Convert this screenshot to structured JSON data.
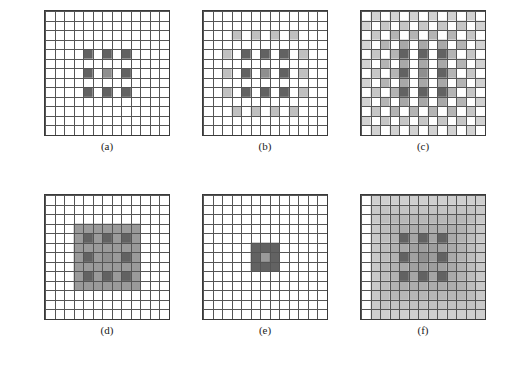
{
  "figure": {
    "title": "",
    "background": "#ffffff",
    "grid_line_color": "#555555",
    "grid_border_color": "#3a3a3a",
    "cell_empty_color": "#ffffff",
    "rows": 2,
    "cols": 3,
    "grid_size": 13
  },
  "palette": {
    "dark": "#626262",
    "dark_alt": "#6b6b6b",
    "mid": "#8f8f8f",
    "light": "#b4b4b4",
    "lighter": "#c9c9c9",
    "lightest": "#dcdcdc",
    "white": "#ffffff"
  },
  "panels": [
    {
      "id": "a",
      "caption": "(a)",
      "description": "sparse 3x3 checkerboard of dark cells at center",
      "size": 13,
      "cells": [
        {
          "r": 4,
          "c": 4,
          "color": "#626262"
        },
        {
          "r": 4,
          "c": 6,
          "color": "#626262"
        },
        {
          "r": 4,
          "c": 8,
          "color": "#626262"
        },
        {
          "r": 6,
          "c": 4,
          "color": "#626262"
        },
        {
          "r": 6,
          "c": 6,
          "color": "#8f8f8f"
        },
        {
          "r": 6,
          "c": 8,
          "color": "#626262"
        },
        {
          "r": 8,
          "c": 4,
          "color": "#626262"
        },
        {
          "r": 8,
          "c": 6,
          "color": "#626262"
        },
        {
          "r": 8,
          "c": 8,
          "color": "#626262"
        }
      ]
    },
    {
      "id": "b",
      "caption": "(b)",
      "description": "dark core plus one light-gray checkerboard ring",
      "size": 13,
      "cells": [
        {
          "r": 2,
          "c": 3,
          "color": "#c0c0c0"
        },
        {
          "r": 2,
          "c": 5,
          "color": "#c0c0c0"
        },
        {
          "r": 2,
          "c": 7,
          "color": "#c0c0c0"
        },
        {
          "r": 2,
          "c": 9,
          "color": "#c0c0c0"
        },
        {
          "r": 4,
          "c": 2,
          "color": "#c0c0c0"
        },
        {
          "r": 4,
          "c": 4,
          "color": "#626262"
        },
        {
          "r": 4,
          "c": 6,
          "color": "#626262"
        },
        {
          "r": 4,
          "c": 8,
          "color": "#626262"
        },
        {
          "r": 4,
          "c": 10,
          "color": "#c0c0c0"
        },
        {
          "r": 6,
          "c": 2,
          "color": "#c0c0c0"
        },
        {
          "r": 6,
          "c": 4,
          "color": "#626262"
        },
        {
          "r": 6,
          "c": 6,
          "color": "#8f8f8f"
        },
        {
          "r": 6,
          "c": 8,
          "color": "#626262"
        },
        {
          "r": 6,
          "c": 10,
          "color": "#c0c0c0"
        },
        {
          "r": 8,
          "c": 2,
          "color": "#c0c0c0"
        },
        {
          "r": 8,
          "c": 4,
          "color": "#626262"
        },
        {
          "r": 8,
          "c": 6,
          "color": "#626262"
        },
        {
          "r": 8,
          "c": 8,
          "color": "#626262"
        },
        {
          "r": 8,
          "c": 10,
          "color": "#c0c0c0"
        },
        {
          "r": 10,
          "c": 3,
          "color": "#c0c0c0"
        },
        {
          "r": 10,
          "c": 5,
          "color": "#c0c0c0"
        },
        {
          "r": 10,
          "c": 7,
          "color": "#c0c0c0"
        },
        {
          "r": 10,
          "c": 9,
          "color": "#c0c0c0"
        }
      ]
    },
    {
      "id": "c",
      "caption": "(c)",
      "description": "dark core plus wide light-gray checkerboard field",
      "size": 13,
      "cells": [
        {
          "r": 0,
          "c": 1,
          "color": "#d2d2d2"
        },
        {
          "r": 0,
          "c": 3,
          "color": "#d2d2d2"
        },
        {
          "r": 0,
          "c": 5,
          "color": "#d2d2d2"
        },
        {
          "r": 0,
          "c": 7,
          "color": "#d2d2d2"
        },
        {
          "r": 0,
          "c": 9,
          "color": "#d2d2d2"
        },
        {
          "r": 0,
          "c": 11,
          "color": "#d2d2d2"
        },
        {
          "r": 1,
          "c": 0,
          "color": "#d2d2d2"
        },
        {
          "r": 1,
          "c": 2,
          "color": "#c6c6c6"
        },
        {
          "r": 1,
          "c": 4,
          "color": "#c6c6c6"
        },
        {
          "r": 1,
          "c": 6,
          "color": "#c6c6c6"
        },
        {
          "r": 1,
          "c": 8,
          "color": "#c6c6c6"
        },
        {
          "r": 1,
          "c": 10,
          "color": "#c6c6c6"
        },
        {
          "r": 1,
          "c": 12,
          "color": "#d2d2d2"
        },
        {
          "r": 2,
          "c": 1,
          "color": "#c6c6c6"
        },
        {
          "r": 2,
          "c": 3,
          "color": "#b4b4b4"
        },
        {
          "r": 2,
          "c": 5,
          "color": "#b4b4b4"
        },
        {
          "r": 2,
          "c": 7,
          "color": "#b4b4b4"
        },
        {
          "r": 2,
          "c": 9,
          "color": "#b4b4b4"
        },
        {
          "r": 2,
          "c": 11,
          "color": "#c6c6c6"
        },
        {
          "r": 3,
          "c": 0,
          "color": "#d2d2d2"
        },
        {
          "r": 3,
          "c": 2,
          "color": "#b4b4b4"
        },
        {
          "r": 3,
          "c": 4,
          "color": "#a8a8a8"
        },
        {
          "r": 3,
          "c": 6,
          "color": "#a8a8a8"
        },
        {
          "r": 3,
          "c": 8,
          "color": "#a8a8a8"
        },
        {
          "r": 3,
          "c": 10,
          "color": "#b4b4b4"
        },
        {
          "r": 3,
          "c": 12,
          "color": "#d2d2d2"
        },
        {
          "r": 4,
          "c": 1,
          "color": "#c6c6c6"
        },
        {
          "r": 4,
          "c": 3,
          "color": "#b4b4b4"
        },
        {
          "r": 4,
          "c": 4,
          "color": "#626262"
        },
        {
          "r": 4,
          "c": 6,
          "color": "#626262"
        },
        {
          "r": 4,
          "c": 8,
          "color": "#626262"
        },
        {
          "r": 4,
          "c": 9,
          "color": "#b4b4b4"
        },
        {
          "r": 4,
          "c": 11,
          "color": "#c6c6c6"
        },
        {
          "r": 5,
          "c": 0,
          "color": "#d2d2d2"
        },
        {
          "r": 5,
          "c": 2,
          "color": "#b4b4b4"
        },
        {
          "r": 5,
          "c": 4,
          "color": "#a8a8a8"
        },
        {
          "r": 5,
          "c": 6,
          "color": "#a8a8a8"
        },
        {
          "r": 5,
          "c": 8,
          "color": "#a8a8a8"
        },
        {
          "r": 5,
          "c": 10,
          "color": "#b4b4b4"
        },
        {
          "r": 5,
          "c": 12,
          "color": "#d2d2d2"
        },
        {
          "r": 6,
          "c": 1,
          "color": "#c6c6c6"
        },
        {
          "r": 6,
          "c": 3,
          "color": "#b4b4b4"
        },
        {
          "r": 6,
          "c": 4,
          "color": "#626262"
        },
        {
          "r": 6,
          "c": 6,
          "color": "#8f8f8f"
        },
        {
          "r": 6,
          "c": 8,
          "color": "#626262"
        },
        {
          "r": 6,
          "c": 9,
          "color": "#b4b4b4"
        },
        {
          "r": 6,
          "c": 11,
          "color": "#c6c6c6"
        },
        {
          "r": 7,
          "c": 0,
          "color": "#d2d2d2"
        },
        {
          "r": 7,
          "c": 2,
          "color": "#b4b4b4"
        },
        {
          "r": 7,
          "c": 4,
          "color": "#a8a8a8"
        },
        {
          "r": 7,
          "c": 6,
          "color": "#a8a8a8"
        },
        {
          "r": 7,
          "c": 8,
          "color": "#a8a8a8"
        },
        {
          "r": 7,
          "c": 10,
          "color": "#b4b4b4"
        },
        {
          "r": 7,
          "c": 12,
          "color": "#d2d2d2"
        },
        {
          "r": 8,
          "c": 1,
          "color": "#c6c6c6"
        },
        {
          "r": 8,
          "c": 3,
          "color": "#b4b4b4"
        },
        {
          "r": 8,
          "c": 4,
          "color": "#626262"
        },
        {
          "r": 8,
          "c": 6,
          "color": "#626262"
        },
        {
          "r": 8,
          "c": 8,
          "color": "#626262"
        },
        {
          "r": 8,
          "c": 9,
          "color": "#b4b4b4"
        },
        {
          "r": 8,
          "c": 11,
          "color": "#c6c6c6"
        },
        {
          "r": 9,
          "c": 0,
          "color": "#d2d2d2"
        },
        {
          "r": 9,
          "c": 2,
          "color": "#b4b4b4"
        },
        {
          "r": 9,
          "c": 4,
          "color": "#a8a8a8"
        },
        {
          "r": 9,
          "c": 6,
          "color": "#a8a8a8"
        },
        {
          "r": 9,
          "c": 8,
          "color": "#a8a8a8"
        },
        {
          "r": 9,
          "c": 10,
          "color": "#b4b4b4"
        },
        {
          "r": 9,
          "c": 12,
          "color": "#d2d2d2"
        },
        {
          "r": 10,
          "c": 1,
          "color": "#c6c6c6"
        },
        {
          "r": 10,
          "c": 3,
          "color": "#b4b4b4"
        },
        {
          "r": 10,
          "c": 5,
          "color": "#b4b4b4"
        },
        {
          "r": 10,
          "c": 7,
          "color": "#b4b4b4"
        },
        {
          "r": 10,
          "c": 9,
          "color": "#b4b4b4"
        },
        {
          "r": 10,
          "c": 11,
          "color": "#c6c6c6"
        },
        {
          "r": 11,
          "c": 0,
          "color": "#d2d2d2"
        },
        {
          "r": 11,
          "c": 2,
          "color": "#c6c6c6"
        },
        {
          "r": 11,
          "c": 4,
          "color": "#c6c6c6"
        },
        {
          "r": 11,
          "c": 6,
          "color": "#c6c6c6"
        },
        {
          "r": 11,
          "c": 8,
          "color": "#c6c6c6"
        },
        {
          "r": 11,
          "c": 10,
          "color": "#c6c6c6"
        },
        {
          "r": 11,
          "c": 12,
          "color": "#d2d2d2"
        },
        {
          "r": 12,
          "c": 1,
          "color": "#d2d2d2"
        },
        {
          "r": 12,
          "c": 3,
          "color": "#d2d2d2"
        },
        {
          "r": 12,
          "c": 5,
          "color": "#d2d2d2"
        },
        {
          "r": 12,
          "c": 7,
          "color": "#d2d2d2"
        },
        {
          "r": 12,
          "c": 9,
          "color": "#d2d2d2"
        },
        {
          "r": 12,
          "c": 11,
          "color": "#d2d2d2"
        }
      ]
    },
    {
      "id": "d",
      "caption": "(d)",
      "description": "solid mid-gray 7x7 block containing dark checkerboard core",
      "size": 13,
      "block": {
        "r0": 3,
        "c0": 3,
        "r1": 9,
        "c1": 9,
        "color": "#9a9a9a"
      },
      "cells": [
        {
          "r": 4,
          "c": 4,
          "color": "#626262"
        },
        {
          "r": 4,
          "c": 6,
          "color": "#626262"
        },
        {
          "r": 4,
          "c": 8,
          "color": "#626262"
        },
        {
          "r": 6,
          "c": 4,
          "color": "#626262"
        },
        {
          "r": 6,
          "c": 6,
          "color": "#8f8f8f"
        },
        {
          "r": 6,
          "c": 8,
          "color": "#626262"
        },
        {
          "r": 8,
          "c": 4,
          "color": "#626262"
        },
        {
          "r": 8,
          "c": 6,
          "color": "#626262"
        },
        {
          "r": 8,
          "c": 8,
          "color": "#626262"
        }
      ]
    },
    {
      "id": "e",
      "caption": "(e)",
      "description": "solid dark 3x3 block with lighter center cell",
      "size": 13,
      "block": {
        "r0": 5,
        "c0": 5,
        "r1": 7,
        "c1": 7,
        "color": "#626262"
      },
      "cells": [
        {
          "r": 6,
          "c": 6,
          "color": "#9a9a9a"
        }
      ]
    },
    {
      "id": "f",
      "caption": "(f)",
      "description": "broad radial gray gradient field with dark checkerboard core",
      "size": 13,
      "gradient": {
        "r0": 0,
        "c0": 1,
        "r1": 12,
        "c1": 12,
        "center_color": "#9a9a9a",
        "edge_color": "#cfcfcf"
      },
      "cells": [
        {
          "r": 4,
          "c": 4,
          "color": "#626262"
        },
        {
          "r": 4,
          "c": 6,
          "color": "#626262"
        },
        {
          "r": 4,
          "c": 8,
          "color": "#626262"
        },
        {
          "r": 6,
          "c": 4,
          "color": "#626262"
        },
        {
          "r": 6,
          "c": 6,
          "color": "#8f8f8f"
        },
        {
          "r": 6,
          "c": 8,
          "color": "#626262"
        },
        {
          "r": 8,
          "c": 4,
          "color": "#626262"
        },
        {
          "r": 8,
          "c": 6,
          "color": "#626262"
        },
        {
          "r": 8,
          "c": 8,
          "color": "#626262"
        }
      ]
    }
  ]
}
